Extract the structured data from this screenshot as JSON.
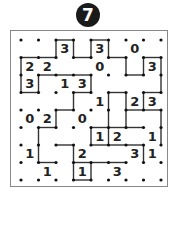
{
  "puzzle": {
    "number": "7",
    "type": "slitherlink",
    "grid": {
      "cols": 8,
      "rows": 8
    },
    "clues": [
      {
        "r": 0,
        "c": 2,
        "v": "3"
      },
      {
        "r": 0,
        "c": 4,
        "v": "3"
      },
      {
        "r": 0,
        "c": 6,
        "v": "0"
      },
      {
        "r": 1,
        "c": 0,
        "v": "2"
      },
      {
        "r": 1,
        "c": 1,
        "v": "2"
      },
      {
        "r": 1,
        "c": 4,
        "v": "0"
      },
      {
        "r": 1,
        "c": 7,
        "v": "3"
      },
      {
        "r": 2,
        "c": 0,
        "v": "3"
      },
      {
        "r": 2,
        "c": 2,
        "v": "1"
      },
      {
        "r": 2,
        "c": 3,
        "v": "3"
      },
      {
        "r": 3,
        "c": 4,
        "v": "1"
      },
      {
        "r": 3,
        "c": 6,
        "v": "2"
      },
      {
        "r": 3,
        "c": 7,
        "v": "3"
      },
      {
        "r": 4,
        "c": 0,
        "v": "0"
      },
      {
        "r": 4,
        "c": 1,
        "v": "2"
      },
      {
        "r": 4,
        "c": 3,
        "v": "0"
      },
      {
        "r": 5,
        "c": 4,
        "v": "1"
      },
      {
        "r": 5,
        "c": 5,
        "v": "2"
      },
      {
        "r": 5,
        "c": 7,
        "v": "1"
      },
      {
        "r": 6,
        "c": 0,
        "v": "1"
      },
      {
        "r": 6,
        "c": 3,
        "v": "2"
      },
      {
        "r": 6,
        "c": 6,
        "v": "3"
      },
      {
        "r": 6,
        "c": 7,
        "v": "1"
      },
      {
        "r": 7,
        "c": 1,
        "v": "1"
      },
      {
        "r": 7,
        "c": 3,
        "v": "1"
      },
      {
        "r": 7,
        "c": 5,
        "v": "3"
      }
    ],
    "h_edges": [
      [
        0,
        2
      ],
      [
        0,
        4
      ],
      [
        1,
        0
      ],
      [
        1,
        1
      ],
      [
        1,
        3
      ],
      [
        1,
        5
      ],
      [
        1,
        7
      ],
      [
        2,
        1
      ],
      [
        2,
        2
      ],
      [
        2,
        3
      ],
      [
        2,
        6
      ],
      [
        3,
        0
      ],
      [
        3,
        3
      ],
      [
        3,
        5
      ],
      [
        3,
        7
      ],
      [
        4,
        2
      ],
      [
        4,
        6
      ],
      [
        4,
        7
      ],
      [
        5,
        1
      ],
      [
        5,
        4
      ],
      [
        5,
        5
      ],
      [
        5,
        6
      ],
      [
        6,
        2
      ],
      [
        6,
        4
      ],
      [
        6,
        5
      ],
      [
        6,
        6
      ],
      [
        7,
        1
      ],
      [
        7,
        3
      ],
      [
        7,
        4
      ],
      [
        7,
        5
      ],
      [
        8,
        3
      ]
    ],
    "v_edges": [
      [
        0,
        2
      ],
      [
        0,
        3
      ],
      [
        0,
        4
      ],
      [
        0,
        5
      ],
      [
        1,
        0
      ],
      [
        1,
        6
      ],
      [
        1,
        7
      ],
      [
        1,
        8
      ],
      [
        2,
        0
      ],
      [
        2,
        1
      ],
      [
        2,
        4
      ],
      [
        2,
        8
      ],
      [
        3,
        3
      ],
      [
        3,
        5
      ],
      [
        3,
        6
      ],
      [
        3,
        7
      ],
      [
        4,
        2
      ],
      [
        4,
        5
      ],
      [
        4,
        6
      ],
      [
        4,
        8
      ],
      [
        5,
        1
      ],
      [
        5,
        4
      ],
      [
        5,
        5
      ],
      [
        5,
        8
      ],
      [
        6,
        1
      ],
      [
        6,
        3
      ],
      [
        6,
        7
      ],
      [
        7,
        3
      ],
      [
        7,
        4
      ]
    ]
  }
}
